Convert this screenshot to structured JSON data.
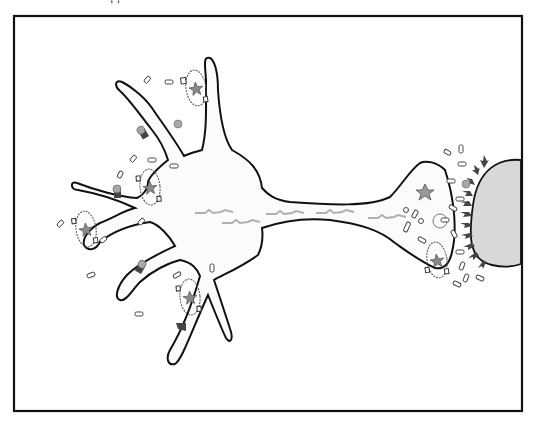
{
  "figure": {
    "title_cut": "           ,             ,               ",
    "frame": {
      "x": 14,
      "y": 16,
      "width": 508,
      "height": 395,
      "stroke": "#111111"
    },
    "colors": {
      "outline": "#111111",
      "cell_fill": "#fbfbfb",
      "target_fill": "#d8d8d8",
      "signal": "#b0b0b0",
      "receptor": "#444444",
      "ball": "#a8a8a8",
      "vesicle_stroke": "#333333",
      "star": "#8a8a8a"
    },
    "neuron": {
      "label": "neuron",
      "parts": [
        "soma",
        "dendrites",
        "axon",
        "axon-terminal"
      ]
    },
    "target_cell": {
      "label": "postsynaptic-cell"
    },
    "signals": [
      {
        "x": 195,
        "y": 212,
        "w": 38
      },
      {
        "x": 222,
        "y": 222,
        "w": 38
      },
      {
        "x": 266,
        "y": 213,
        "w": 38
      },
      {
        "x": 316,
        "y": 212,
        "w": 38
      },
      {
        "x": 368,
        "y": 217,
        "w": 38
      }
    ],
    "vesicle_clusters": [
      {
        "cx": 196,
        "cy": 88,
        "rx": 10,
        "ry": 18,
        "rot": -8
      },
      {
        "cx": 150,
        "cy": 187,
        "rx": 10,
        "ry": 18,
        "rot": -5
      },
      {
        "cx": 86,
        "cy": 229,
        "rx": 10,
        "ry": 18,
        "rot": -8
      },
      {
        "cx": 190,
        "cy": 297,
        "rx": 10,
        "ry": 18,
        "rot": -5
      },
      {
        "cx": 437,
        "cy": 260,
        "rx": 10,
        "ry": 18,
        "rot": -8
      }
    ],
    "receptors": [
      {
        "x": 142,
        "y": 132,
        "rot": -30
      },
      {
        "x": 117,
        "y": 191,
        "rot": 0
      },
      {
        "x": 141,
        "y": 266,
        "rot": 30
      },
      {
        "x": 182,
        "y": 324,
        "rot": 20
      }
    ],
    "free_balls": [
      {
        "x": 178,
        "y": 124
      },
      {
        "x": 465,
        "y": 184
      }
    ]
  }
}
